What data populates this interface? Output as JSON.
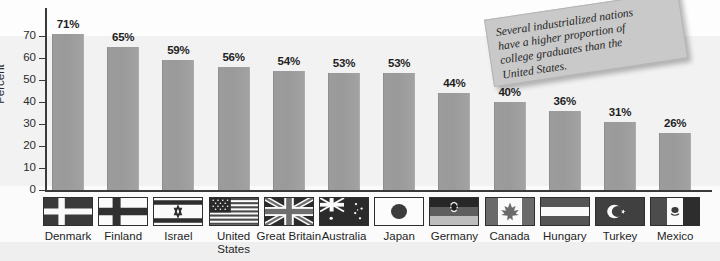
{
  "chart_data": {
    "type": "bar",
    "title": "",
    "xlabel": "",
    "ylabel": "Percent",
    "ylim": [
      0,
      75
    ],
    "yticks": [
      0,
      10,
      20,
      30,
      40,
      50,
      60,
      70
    ],
    "grid": false,
    "legend": "none",
    "categories": [
      "Denmark",
      "Finland",
      "Israel",
      "United\nStates",
      "Great Britain",
      "Australia",
      "Japan",
      "Germany",
      "Canada",
      "Hungary",
      "Turkey",
      "Mexico"
    ],
    "values": [
      71,
      65,
      59,
      56,
      54,
      53,
      53,
      44,
      40,
      36,
      31,
      26
    ],
    "value_labels": [
      "71%",
      "65%",
      "59%",
      "56%",
      "54%",
      "53%",
      "53%",
      "44%",
      "40%",
      "36%",
      "31%",
      "26%"
    ],
    "bar_color": "#9a9a9a",
    "annotations": [
      {
        "name": "callout-note",
        "text": "Several industrialized nations have a higher proportion of college graduates than the United States.",
        "rotation_deg": -8.5,
        "background": "#c9c9c9"
      }
    ],
    "flag_icons": [
      "flag-denmark",
      "flag-finland",
      "flag-israel",
      "flag-united-states",
      "flag-great-britain",
      "flag-australia",
      "flag-japan",
      "flag-germany",
      "flag-canada",
      "flag-hungary",
      "flag-turkey",
      "flag-mexico"
    ]
  },
  "axis": {
    "y_title": "Percent",
    "y_tick_labels": [
      "0",
      "10",
      "20",
      "30",
      "40",
      "50",
      "60",
      "70"
    ]
  },
  "note": {
    "line1": "Several industrialized nations",
    "line2": "have a higher proportion of",
    "line3": "college graduates than the",
    "line4": "United States."
  }
}
